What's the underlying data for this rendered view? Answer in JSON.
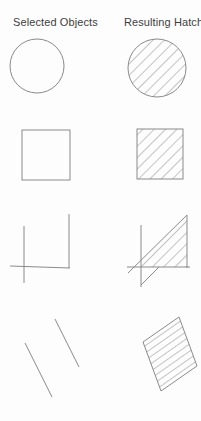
{
  "page": {
    "background": "#fdfdfd",
    "line_color": "#8a8a8a",
    "text_color": "#3e3e3e"
  },
  "headers": [
    {
      "id": "selected-objects",
      "label": "Selected Objects"
    },
    {
      "id": "resulting-hatch",
      "label": "Resulting Hatch"
    }
  ],
  "figure": {
    "width": 201,
    "height": 421,
    "hatch_patterns": {
      "diag": {
        "angle": 45,
        "spacing": 8,
        "orient": "vertical"
      },
      "rows": {
        "angle": -35,
        "spacing": 6,
        "orient": "horizontal"
      }
    },
    "shapes": [
      {
        "name": "selected-circle",
        "row": 1,
        "column": "selected",
        "type": "circle",
        "cx": 37,
        "cy": 66,
        "r": 27,
        "hatch": "none"
      },
      {
        "name": "hatched-circle",
        "row": 1,
        "column": "hatch",
        "type": "circle",
        "cx": 157,
        "cy": 68,
        "r": 29,
        "hatch": "diag"
      },
      {
        "name": "selected-square",
        "row": 2,
        "column": "selected",
        "type": "rect",
        "x": 22,
        "y": 130,
        "w": 48,
        "h": 50,
        "hatch": "none"
      },
      {
        "name": "hatched-square",
        "row": 2,
        "column": "hatch",
        "type": "rect",
        "x": 137,
        "y": 129,
        "w": 46,
        "h": 50,
        "hatch": "diag"
      },
      {
        "name": "selected-open-boundary",
        "row": 3,
        "column": "selected",
        "type": "lines",
        "segments": [
          [
            24,
            226,
            24,
            283
          ],
          [
            10,
            266,
            70,
            268
          ],
          [
            69,
            214,
            69,
            268
          ]
        ]
      },
      {
        "name": "hatch-fill-triangle",
        "row": 3,
        "column": "hatch",
        "type": "polygon",
        "points": [
          [
            134,
            267
          ],
          [
            187,
            215
          ],
          [
            187,
            267
          ]
        ],
        "hatch": "diag",
        "outline": false
      },
      {
        "name": "hatched-open-boundary",
        "row": 3,
        "column": "hatch",
        "type": "lines",
        "segments": [
          [
            141,
            225,
            141,
            287
          ],
          [
            127,
            267,
            190,
            267
          ],
          [
            187,
            215,
            187,
            268
          ],
          [
            128,
            273,
            187,
            215
          ],
          [
            141,
            285,
            159,
            267
          ]
        ]
      },
      {
        "name": "selected-parallel-lines",
        "row": 4,
        "column": "selected",
        "type": "lines",
        "segments": [
          [
            25,
            343,
            52,
            397
          ],
          [
            55,
            319,
            79,
            367
          ]
        ]
      },
      {
        "name": "hatched-parallelogram",
        "row": 4,
        "column": "hatch",
        "type": "polygon",
        "points": [
          [
            143,
            342
          ],
          [
            179,
            317
          ],
          [
            197,
            366
          ],
          [
            161,
            391
          ]
        ],
        "hatch": "rows",
        "outline": true
      }
    ]
  }
}
